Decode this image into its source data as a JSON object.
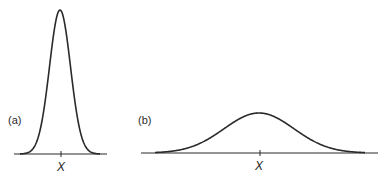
{
  "figure": {
    "panel_a": {
      "label": "(a)",
      "x_label": "X",
      "curve": "narrow"
    },
    "panel_b": {
      "label": "(b)",
      "x_label": "X",
      "curve": "wide"
    },
    "line_color": "#2a2a2a"
  },
  "chart_data": [
    {
      "type": "line",
      "title": "(a)",
      "description": "Narrow, tall bell-shaped (Gaussian) distribution centered on X",
      "xlabel": "X",
      "ylabel": "",
      "center": 0,
      "sigma_relative": 1,
      "peak_relative": 1.0,
      "grid": false,
      "legend": null
    },
    {
      "type": "line",
      "title": "(b)",
      "description": "Wide, low bell-shaped (Gaussian) distribution centered on X",
      "xlabel": "X",
      "ylabel": "",
      "center": 0,
      "sigma_relative": 3.3,
      "peak_relative": 0.29,
      "grid": false,
      "legend": null
    }
  ]
}
